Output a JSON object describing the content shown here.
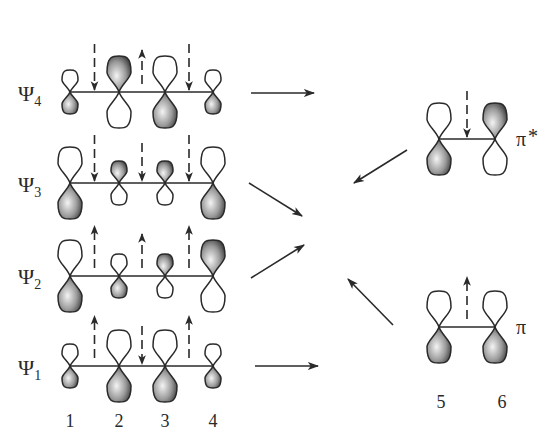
{
  "diagram": {
    "colors": {
      "ink": "#2a2a2a",
      "shade_dark": "#3a3a3a",
      "shade_light": "#f2f2f2",
      "open_fill": "#ffffff"
    },
    "diene": {
      "atom_labels": [
        "1",
        "2",
        "3",
        "4"
      ],
      "orbitals": [
        {
          "name": "Ψ4",
          "label_main": "Ψ",
          "label_sub": "4",
          "lobes": [
            {
              "size": "small",
              "shaded": "bottom"
            },
            {
              "size": "large",
              "shaded": "top"
            },
            {
              "size": "large",
              "shaded": "bottom"
            },
            {
              "size": "small",
              "shaded": "bottom"
            }
          ],
          "polarization_arrows": [
            "down",
            "up",
            "down"
          ]
        },
        {
          "name": "Ψ3",
          "label_main": "Ψ",
          "label_sub": "3",
          "lobes": [
            {
              "size": "large",
              "shaded": "bottom"
            },
            {
              "size": "small",
              "shaded": "top"
            },
            {
              "size": "small",
              "shaded": "top"
            },
            {
              "size": "large",
              "shaded": "bottom"
            }
          ],
          "polarization_arrows": [
            "down",
            "down",
            "down"
          ]
        },
        {
          "name": "Ψ2",
          "label_main": "Ψ",
          "label_sub": "2",
          "lobes": [
            {
              "size": "large",
              "shaded": "bottom"
            },
            {
              "size": "small",
              "shaded": "bottom"
            },
            {
              "size": "small",
              "shaded": "top"
            },
            {
              "size": "large",
              "shaded": "top"
            }
          ],
          "polarization_arrows": [
            "up",
            "up",
            "up"
          ]
        },
        {
          "name": "Ψ1",
          "label_main": "Ψ",
          "label_sub": "1",
          "lobes": [
            {
              "size": "small",
              "shaded": "bottom"
            },
            {
              "size": "large",
              "shaded": "bottom"
            },
            {
              "size": "large",
              "shaded": "bottom"
            },
            {
              "size": "small",
              "shaded": "bottom"
            }
          ],
          "polarization_arrows": [
            "up",
            "down",
            "up"
          ]
        }
      ]
    },
    "alkene": {
      "atom_labels": [
        "5",
        "6"
      ],
      "orbitals": [
        {
          "name": "π*",
          "label_main": "π",
          "label_sup": "*",
          "lobes": [
            {
              "size": "large",
              "shaded": "bottom"
            },
            {
              "size": "large",
              "shaded": "top"
            }
          ],
          "polarization_arrows": [
            "down"
          ]
        },
        {
          "name": "π",
          "label_main": "π",
          "label_sup": "",
          "lobes": [
            {
              "size": "large",
              "shaded": "bottom"
            },
            {
              "size": "large",
              "shaded": "bottom"
            }
          ],
          "polarization_arrows": [
            "up"
          ]
        }
      ]
    },
    "interaction_arrows": [
      {
        "from": "Ψ4",
        "to": "right"
      },
      {
        "from": "Ψ3",
        "to": "center"
      },
      {
        "from": "Ψ2",
        "to": "center"
      },
      {
        "from": "π*",
        "to": "center"
      },
      {
        "from": "π",
        "to": "center"
      },
      {
        "from": "Ψ1",
        "to": "right"
      }
    ]
  }
}
